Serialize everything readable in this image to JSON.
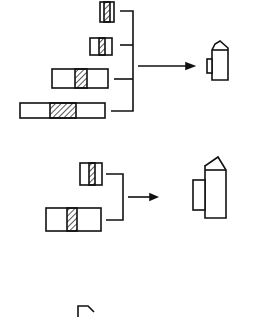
{
  "diagram": {
    "title": "",
    "stroke_color": "#111111",
    "background": "#ffffff",
    "groups": [
      {
        "name": "group-1",
        "inputs": 4,
        "output": "assembled-part-small"
      },
      {
        "name": "group-2",
        "inputs": 2,
        "output": "assembled-part-large"
      }
    ]
  }
}
